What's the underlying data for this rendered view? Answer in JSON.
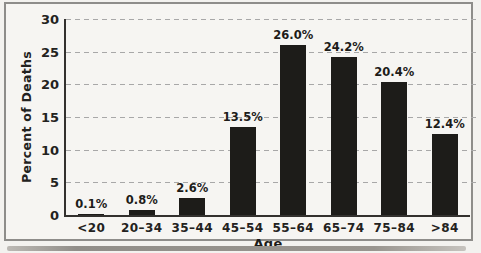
{
  "chart_data": {
    "type": "bar",
    "title": "",
    "categories": [
      "<20",
      "20–34",
      "35–44",
      "45–54",
      "55–64",
      "65–74",
      "75–84",
      ">84"
    ],
    "values": [
      0.1,
      0.8,
      2.6,
      13.5,
      26.0,
      24.2,
      20.4,
      12.4
    ],
    "bar_labels": [
      "0.1%",
      "0.8%",
      "2.6%",
      "13.5%",
      "26.0%",
      "24.2%",
      "20.4%",
      "12.4%"
    ],
    "xlabel": "Age",
    "ylabel": "Percent of Deaths",
    "ylim": [
      0,
      30
    ],
    "yticks": [
      0,
      5,
      10,
      15,
      20,
      25,
      30
    ],
    "grid": "horizontal-dashed",
    "legend": "none",
    "colors": {
      "bar": "#1d1c19",
      "axis": "#33312e",
      "gridline": "#a8a8a8",
      "text": "#232220",
      "frame_border": "#8e8d8a",
      "background": "#f3f2ef"
    }
  }
}
